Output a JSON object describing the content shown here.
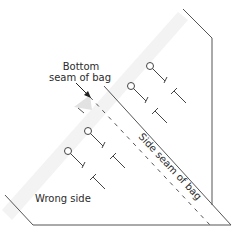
{
  "diagram": {
    "labels": {
      "bottom_seam_line1": "Bottom",
      "bottom_seam_line2": "seam of bag",
      "side_seam": "Side seam of bag",
      "wrong_side": "Wrong side"
    },
    "colors": {
      "line": "#555555",
      "text": "#2b2b2b",
      "fold_highlight": "#f0f0f0",
      "background": "#ffffff"
    },
    "pins": [
      {
        "head_x": 150,
        "head_y": 66
      },
      {
        "head_x": 131,
        "head_y": 86
      },
      {
        "head_x": 88,
        "head_y": 131
      },
      {
        "head_x": 68,
        "head_y": 151
      }
    ],
    "t_marks": [
      {
        "x": 175,
        "y": 90
      },
      {
        "x": 156,
        "y": 110
      },
      {
        "x": 113,
        "y": 155
      },
      {
        "x": 93,
        "y": 176
      }
    ]
  }
}
